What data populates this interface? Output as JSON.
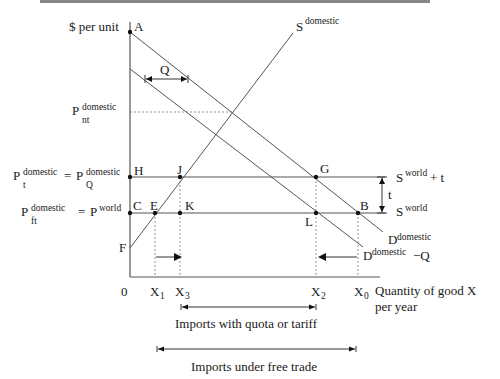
{
  "figure": {
    "axis_labels": {
      "y": "$ per unit",
      "x_line1": "Quantity of good  X",
      "x_line2": "per year",
      "origin": "0"
    },
    "curves": {
      "supply_domestic": {
        "base": "S",
        "sup": "domestic"
      },
      "demand_domestic": {
        "base": "D",
        "sup": "domestic"
      },
      "demand_minus_quota": {
        "base": "D",
        "sup": "domestic",
        "suffix": "−Q"
      },
      "supply_world_plus_t": {
        "base": "S",
        "sup": "world",
        "suffix": "+ t"
      },
      "supply_world": {
        "base": "S",
        "sup": "world"
      }
    },
    "price_labels": {
      "p_nt": {
        "base": "P",
        "sup": "domestic",
        "sub": "nt"
      },
      "p_t": {
        "base": "P",
        "sup": "domestic",
        "sub": "t",
        "eq": "=",
        "base2": "P",
        "sup2": "domestic",
        "sub2": "Q"
      },
      "p_ft": {
        "base": "P",
        "sup": "domestic",
        "sub": "ft",
        "eq": "=",
        "base2": "P",
        "sup2": "world"
      }
    },
    "points": {
      "A": "A",
      "H": "H",
      "J": "J",
      "C": "C",
      "E": "E",
      "K": "K",
      "F": "F",
      "G": "G",
      "L": "L",
      "B": "B"
    },
    "quantity_ticks": {
      "x1": {
        "base": "X",
        "sub": "1"
      },
      "x3": {
        "base": "X",
        "sub": "3"
      },
      "x2": {
        "base": "X",
        "sub": "2"
      },
      "x0": {
        "base": "X",
        "sub": "0"
      }
    },
    "annotations": {
      "quota_gap": "Q",
      "tariff": "t",
      "imports_quota_tariff": "Imports with quota or tariff",
      "imports_free_trade": "Imports under free trade"
    }
  }
}
